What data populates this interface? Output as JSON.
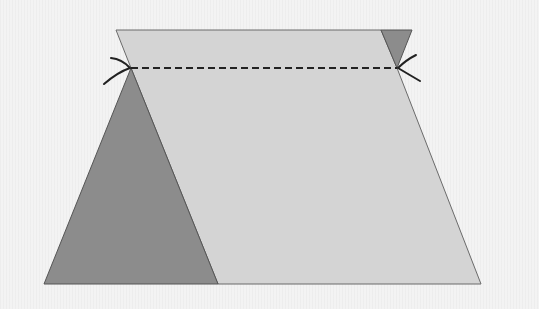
{
  "diagram": {
    "type": "geometric-dissection",
    "colors": {
      "background": "#f3f3f3",
      "light_fill": "#d4d4d4",
      "dark_fill": "#8c8c8c",
      "stroke": "#555555",
      "dashed_line": "#222222",
      "arc_marks": "#222222"
    },
    "shapes": {
      "light_region": {
        "points": "116,30 381,30 397,68 481,284 218,284 131,68"
      },
      "dark_large_triangle": {
        "points": "131,68 44,284 218,284"
      },
      "dark_small_triangle": {
        "points": "381,30 412,30 397,68"
      }
    },
    "dashed_line": {
      "x1": 131,
      "y1": 68,
      "x2": 397,
      "y2": 68
    },
    "arc_marks": [
      {
        "side": "left",
        "at": [
          131,
          68
        ]
      },
      {
        "side": "right",
        "at": [
          397,
          68
        ]
      }
    ]
  }
}
